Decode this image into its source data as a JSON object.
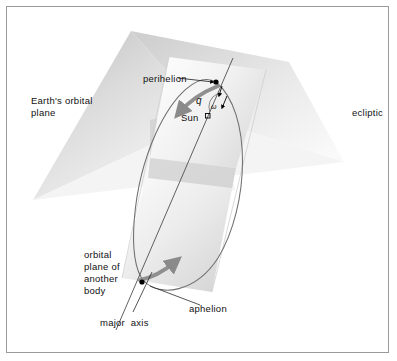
{
  "figure": {
    "width": 397,
    "height": 361,
    "background_color": "#ffffff",
    "frame_color": "#9a9a9a"
  },
  "labels": {
    "earth_orbital_plane_line1": "Earth's orbital",
    "earth_orbital_plane_line2": "plane",
    "ecliptic": "ecliptic",
    "perihelion": "perihelion",
    "sun": "Sun",
    "angle_q": "q",
    "angle_omega": "ω",
    "orbital_plane_line1": "orbital",
    "orbital_plane_line2": "plane of",
    "orbital_plane_line3": "another",
    "orbital_plane_line4": "body",
    "aphelion": "aphelion",
    "major_axis": "major  axis"
  },
  "colors": {
    "plane_ecliptic_light": "#f2f2f2",
    "plane_ecliptic_mid": "#d8d8d8",
    "plane_ecliptic_dark": "#b8b8b8",
    "plane_orbit_light": "#fbfbfb",
    "plane_orbit_mid": "#e6e6e6",
    "orbit_line": "#6b6b6b",
    "axis_line": "#555555",
    "arrow_gray": "#8a8a8a",
    "text": "#111111",
    "marker": "#000000"
  },
  "geometry": {
    "ecliptic_plane_vertices": "131,31 289,62 340,160 33,200",
    "orbital_plane_vertices": "171,58 265,71 215,292 124,278",
    "sun_marker": {
      "x": 208,
      "y": 118,
      "size": 5
    },
    "perihelion_marker": {
      "x": 216,
      "y": 82
    },
    "aphelion_marker": {
      "x": 142,
      "y": 283
    },
    "major_axis_from": {
      "x": 230,
      "y": 62
    },
    "major_axis_to": {
      "x": 128,
      "y": 320
    },
    "orbit_ellipse_note": "elongated ellipse from perihelion near top to aphelion near bottom-left"
  },
  "annotations": [
    {
      "name": "perihelion",
      "leader_from": [
        180,
        78
      ],
      "leader_to": [
        213,
        83
      ]
    },
    {
      "name": "aphelion",
      "leader_from": [
        204,
        304
      ],
      "leader_to": [
        150,
        285
      ]
    },
    {
      "name": "major-axis",
      "leader_from": [
        132,
        312
      ],
      "leader_to": [
        152,
        272
      ]
    }
  ]
}
